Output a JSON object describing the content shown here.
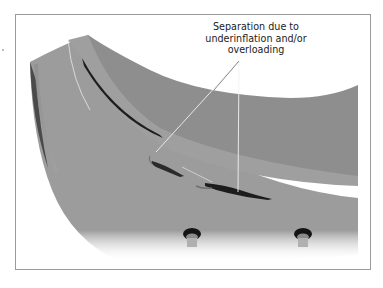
{
  "figure": {
    "type": "tire-cross-section-illustration",
    "callout": {
      "lines": [
        "Separation due to",
        "underinflation and/or",
        "overloading"
      ],
      "leader_line_count": 2
    },
    "colors": {
      "tire_light": "#9e9e9e",
      "tire_inner": "#8f8f8f",
      "crack": "#1e1e1e",
      "frame_border": "#9a9a9a",
      "leader_line": "#f2f2f2",
      "label_text": "#222222"
    },
    "elements": [
      "tire-sidewall",
      "tire-tread-surface",
      "ply-separation-crack",
      "valve-stem-left",
      "valve-stem-right"
    ]
  }
}
